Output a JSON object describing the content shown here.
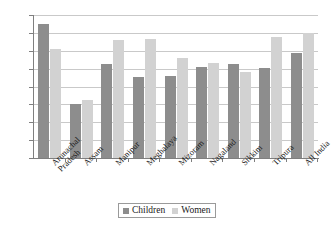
{
  "chart_data": {
    "type": "bar",
    "title": "",
    "subtitle": "",
    "xlabel": "",
    "ylabel": "",
    "ylim": [
      0.0,
      16.0
    ],
    "ytick_step": 2.0,
    "yticks": [
      "16.0",
      "14.0",
      "12.0",
      "10.0",
      "8.0",
      "6.0",
      "4.0",
      "2.0",
      "0.0"
    ],
    "ytick_values": [
      16.0,
      14.0,
      12.0,
      10.0,
      8.0,
      6.0,
      4.0,
      2.0,
      0.0
    ],
    "grid": true,
    "grid_axis": "y",
    "legend_position": "bottom-center",
    "categories": [
      "Arunachal Pradesh",
      "Assam",
      "Manipur",
      "Meghalaya",
      "Mizoram",
      "Nagaland",
      "Sikkim",
      "Tripura",
      "All India"
    ],
    "series": [
      {
        "name": "Children",
        "color": "#8d8d8d",
        "values": [
          15.0,
          6.0,
          10.5,
          9.1,
          9.2,
          10.2,
          10.5,
          10.1,
          11.8
        ]
      },
      {
        "name": "Women",
        "color": "#d2d2d2",
        "values": [
          12.2,
          6.5,
          13.2,
          13.3,
          11.2,
          10.6,
          9.6,
          13.5,
          14.0
        ]
      }
    ]
  },
  "legend": {
    "items": [
      {
        "label": "Children",
        "color": "#8d8d8d"
      },
      {
        "label": "Women",
        "color": "#d2d2d2"
      }
    ]
  },
  "colors": {
    "children": "#8d8d8d",
    "women": "#d2d2d2",
    "gridline": "#c9c9c9",
    "axis": "#7f7f7f",
    "text": "#1a1a1a",
    "background": "#ffffff"
  }
}
